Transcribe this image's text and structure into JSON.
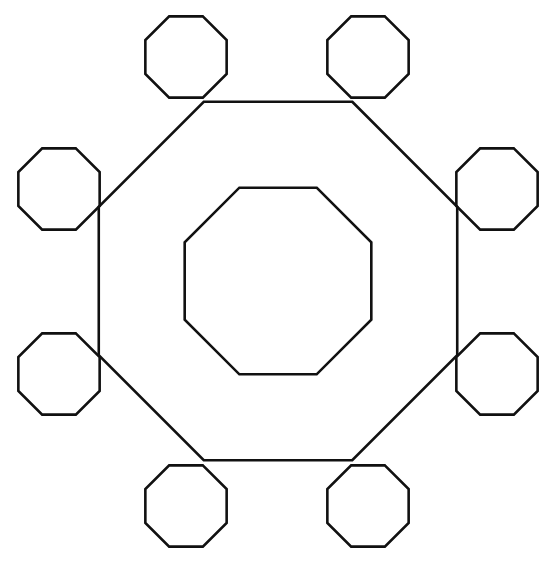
{
  "figure": {
    "background_color": "#ffffff",
    "stroke_color": "#111111",
    "canvas": {
      "width": 558,
      "height": 567
    }
  },
  "chart_data": {
    "type": "diagram",
    "shape_type": "regular-octagon",
    "sides": 8,
    "total_shapes": 10,
    "center": {
      "x": 278,
      "y": 281
    },
    "shapes": [
      {
        "name": "outer-octagon",
        "role": "large outer ring octagon",
        "center": {
          "x": 278,
          "y": 281
        },
        "circumradius": 194,
        "rotation_deg": 22.5,
        "stroke_width": 2.6,
        "bbox": {
          "x1": 99,
          "y1": 98,
          "x2": 457,
          "y2": 464
        }
      },
      {
        "name": "inner-octagon",
        "role": "small concentric octagon at center",
        "center": {
          "x": 278,
          "y": 281
        },
        "circumradius": 101,
        "rotation_deg": 22.5,
        "stroke_width": 2.6,
        "bbox": {
          "x1": 184,
          "y1": 186,
          "x2": 371,
          "y2": 375
        }
      },
      {
        "name": "satellite-octagon-top-left",
        "role": "corner octagon",
        "center": {
          "x": 186,
          "y": 57
        },
        "circumradius": 44,
        "rotation_deg": 22.5,
        "stroke_width": 2.6
      },
      {
        "name": "satellite-octagon-top-right",
        "role": "corner octagon",
        "center": {
          "x": 368,
          "y": 57
        },
        "circumradius": 44,
        "rotation_deg": 22.5,
        "stroke_width": 2.6
      },
      {
        "name": "satellite-octagon-left-upper",
        "role": "corner octagon",
        "center": {
          "x": 59,
          "y": 189
        },
        "circumradius": 44,
        "rotation_deg": 22.5,
        "stroke_width": 2.6
      },
      {
        "name": "satellite-octagon-right-upper",
        "role": "corner octagon",
        "center": {
          "x": 497,
          "y": 189
        },
        "circumradius": 44,
        "rotation_deg": 22.5,
        "stroke_width": 2.6
      },
      {
        "name": "satellite-octagon-left-lower",
        "role": "corner octagon",
        "center": {
          "x": 59,
          "y": 374
        },
        "circumradius": 44,
        "rotation_deg": 22.5,
        "stroke_width": 2.6
      },
      {
        "name": "satellite-octagon-right-lower",
        "role": "corner octagon",
        "center": {
          "x": 497,
          "y": 374
        },
        "circumradius": 44,
        "rotation_deg": 22.5,
        "stroke_width": 2.6
      },
      {
        "name": "satellite-octagon-bottom-left",
        "role": "corner octagon",
        "center": {
          "x": 186,
          "y": 506
        },
        "circumradius": 44,
        "rotation_deg": 22.5,
        "stroke_width": 2.6
      },
      {
        "name": "satellite-octagon-bottom-right",
        "role": "corner octagon",
        "center": {
          "x": 368,
          "y": 506
        },
        "circumradius": 44,
        "rotation_deg": 22.5,
        "stroke_width": 2.6
      }
    ]
  }
}
